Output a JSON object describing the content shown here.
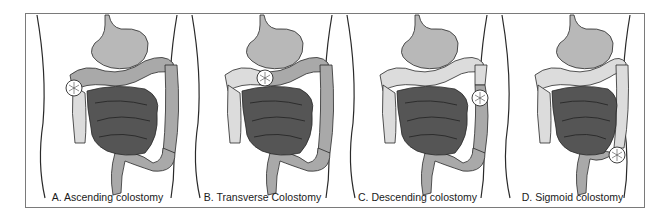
{
  "figure": {
    "panels": [
      {
        "id": "A",
        "label": "A. Ascending colostomy",
        "stoma_location": "ascending colon"
      },
      {
        "id": "B",
        "label": "B. Transverse Colostomy",
        "stoma_location": "transverse colon"
      },
      {
        "id": "C",
        "label": "C. Descending colostomy",
        "stoma_location": "descending colon"
      },
      {
        "id": "D",
        "label": "D. Sigmoid colostomy",
        "stoma_location": "sigmoid colon"
      }
    ],
    "colors": {
      "stomach": "#b8b8b8",
      "active_colon": "#a9a9a9",
      "inactive_colon": "#dcdcdc",
      "small_intestine": "#555555",
      "outline": "#2a2a2a",
      "stoma": "#ffffff",
      "frame": "#7a7a7a"
    }
  }
}
